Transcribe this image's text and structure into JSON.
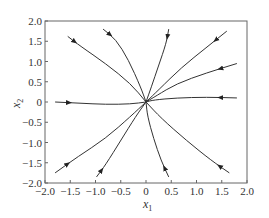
{
  "chart_data": {
    "type": "line",
    "title": "",
    "xlabel": "x1",
    "ylabel": "x2",
    "xlim": [
      -2.0,
      2.0
    ],
    "ylim": [
      -2.0,
      2.0
    ],
    "grid": false,
    "xticks": [
      "-2.0",
      "-1.5",
      "-1.0",
      "-0.5",
      "0",
      "0.5",
      "1.0",
      "1.5",
      "2.0"
    ],
    "yticks": [
      "-2.0",
      "-1.5",
      "-1.0",
      "-0.5",
      "0",
      "0.5",
      "1.0",
      "1.5",
      "2.0"
    ],
    "series": [
      {
        "name": "traj-1",
        "x": [
          -1.55,
          -1.3,
          -0.8,
          -0.3,
          0
        ],
        "y": [
          1.62,
          1.38,
          0.95,
          0.45,
          0
        ]
      },
      {
        "name": "traj-2",
        "x": [
          -0.85,
          -0.6,
          -0.35,
          -0.1,
          0
        ],
        "y": [
          1.8,
          1.55,
          1.05,
          0.35,
          0
        ]
      },
      {
        "name": "traj-3",
        "x": [
          0.45,
          0.4,
          0.25,
          0.1,
          0
        ],
        "y": [
          1.8,
          1.45,
          0.9,
          0.35,
          0
        ]
      },
      {
        "name": "traj-4",
        "x": [
          1.6,
          1.2,
          0.7,
          0.25,
          0
        ],
        "y": [
          1.75,
          1.35,
          0.85,
          0.3,
          0
        ]
      },
      {
        "name": "traj-5",
        "x": [
          1.8,
          1.2,
          0.6,
          0.2,
          0
        ],
        "y": [
          0.95,
          0.72,
          0.45,
          0.15,
          0
        ]
      },
      {
        "name": "traj-6",
        "x": [
          1.8,
          1.2,
          0.6,
          0.15,
          0
        ],
        "y": [
          0.1,
          0.12,
          0.1,
          0.05,
          0
        ]
      },
      {
        "name": "traj-7",
        "x": [
          1.65,
          1.3,
          0.8,
          0.3,
          0
        ],
        "y": [
          -1.75,
          -1.45,
          -0.95,
          -0.4,
          0
        ]
      },
      {
        "name": "traj-8",
        "x": [
          0.45,
          0.3,
          0.15,
          0.03,
          0
        ],
        "y": [
          -1.85,
          -1.45,
          -0.9,
          -0.35,
          0
        ]
      },
      {
        "name": "traj-9",
        "x": [
          -0.98,
          -0.8,
          -0.5,
          -0.2,
          0
        ],
        "y": [
          -1.85,
          -1.55,
          -0.95,
          -0.35,
          0
        ]
      },
      {
        "name": "traj-10",
        "x": [
          -1.8,
          -1.35,
          -0.8,
          -0.3,
          0
        ],
        "y": [
          -1.75,
          -1.35,
          -0.9,
          -0.35,
          0
        ]
      },
      {
        "name": "traj-11",
        "x": [
          -1.8,
          -1.3,
          -0.8,
          -0.3,
          0
        ],
        "y": [
          0.0,
          -0.03,
          -0.06,
          -0.05,
          0
        ]
      }
    ]
  },
  "axes": {
    "xlabel": "x",
    "xlabel_sub": "1",
    "ylabel": "x",
    "ylabel_sub": "2"
  }
}
